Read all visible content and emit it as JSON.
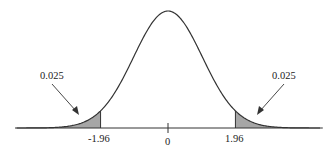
{
  "chart_data": {
    "type": "area",
    "title": "",
    "xlabel": "",
    "ylabel": "",
    "distribution": "standard normal",
    "mean": 0,
    "sd": 1,
    "xlim": [
      -4.4,
      4.5
    ],
    "tick_labels": [
      "-1.96",
      "0",
      "1.96"
    ],
    "tick_values": [
      -1.96,
      0,
      1.96
    ],
    "shaded_regions": [
      {
        "from": -4.4,
        "to": -1.96,
        "area": 0.025,
        "label": "0.025"
      },
      {
        "from": 1.96,
        "to": 4.5,
        "area": 0.025,
        "label": "0.025"
      }
    ],
    "annotations": [
      {
        "text": "0.025",
        "target": "left tail",
        "arrow": true
      },
      {
        "text": "0.025",
        "target": "right tail",
        "arrow": true
      }
    ],
    "grid": false,
    "legend": "none",
    "colors": {
      "curve": "#333333",
      "shade": "#a6a6a6",
      "axis": "#333333"
    }
  },
  "labels": {
    "left_area": "0.025",
    "right_area": "0.025",
    "tick_left": "-1.96",
    "tick_center": "0",
    "tick_right": "1.96"
  }
}
